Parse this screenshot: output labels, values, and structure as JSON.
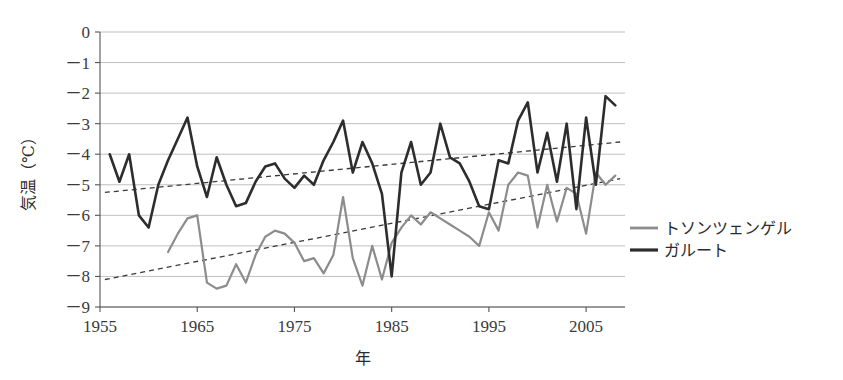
{
  "chart_data": {
    "type": "line",
    "title": "",
    "xlabel": "年",
    "ylabel": "気温（℃）",
    "xlim": [
      1955,
      2009
    ],
    "ylim": [
      -9,
      0
    ],
    "xticks": [
      1955,
      1965,
      1975,
      1985,
      1995,
      2005
    ],
    "yticks": [
      0,
      -1,
      -2,
      -3,
      -4,
      -5,
      -6,
      -7,
      -8,
      -9
    ],
    "ytick_labels": [
      "0",
      "－1",
      "－2",
      "－3",
      "－4",
      "－5",
      "－6",
      "－7",
      "－8",
      "－9"
    ],
    "xtick_labels": [
      "1955",
      "1965",
      "1975",
      "1985",
      "1995",
      "2005"
    ],
    "grid": true,
    "grid_axis": "y",
    "legend_position": "right",
    "series": [
      {
        "name": "トソンツェンゲル",
        "color": "#8c8c8c",
        "width": 2.2,
        "x": [
          1962,
          1963,
          1964,
          1965,
          1966,
          1967,
          1968,
          1969,
          1970,
          1971,
          1972,
          1973,
          1974,
          1975,
          1976,
          1977,
          1978,
          1979,
          1980,
          1981,
          1982,
          1983,
          1984,
          1985,
          1986,
          1987,
          1988,
          1989,
          1990,
          1991,
          1992,
          1993,
          1994,
          1995,
          1996,
          1997,
          1998,
          1999,
          2000,
          2001,
          2002,
          2003,
          2004,
          2005,
          2006,
          2007,
          2008
        ],
        "y": [
          -7.2,
          -6.6,
          -6.1,
          -6.0,
          -8.2,
          -8.4,
          -8.3,
          -7.6,
          -8.2,
          -7.3,
          -6.7,
          -6.5,
          -6.6,
          -6.9,
          -7.5,
          -7.4,
          -7.9,
          -7.3,
          -5.4,
          -7.4,
          -8.3,
          -7.0,
          -8.1,
          -6.9,
          -6.4,
          -6.0,
          -6.3,
          -5.9,
          -6.1,
          -6.3,
          -6.5,
          -6.7,
          -7.0,
          -5.9,
          -6.5,
          -5.0,
          -4.6,
          -4.7,
          -6.4,
          -5.0,
          -6.2,
          -5.1,
          -5.3,
          -6.6,
          -4.6,
          -5.0,
          -4.7
        ]
      },
      {
        "name": "ガルート",
        "color": "#2d2d2d",
        "width": 2.6,
        "x": [
          1956,
          1957,
          1958,
          1959,
          1960,
          1961,
          1962,
          1963,
          1964,
          1965,
          1966,
          1967,
          1968,
          1969,
          1970,
          1971,
          1972,
          1973,
          1974,
          1975,
          1976,
          1977,
          1978,
          1979,
          1980,
          1981,
          1982,
          1983,
          1984,
          1985,
          1986,
          1987,
          1988,
          1989,
          1990,
          1991,
          1992,
          1993,
          1994,
          1995,
          1996,
          1997,
          1998,
          1999,
          2000,
          2001,
          2002,
          2003,
          2004,
          2005,
          2006,
          2007,
          2008
        ],
        "y": [
          -4.0,
          -4.9,
          -4.0,
          -6.0,
          -6.4,
          -5.0,
          -4.2,
          -3.5,
          -2.8,
          -4.4,
          -5.4,
          -4.1,
          -5.0,
          -5.7,
          -5.6,
          -4.9,
          -4.4,
          -4.3,
          -4.8,
          -5.1,
          -4.7,
          -5.0,
          -4.2,
          -3.6,
          -2.9,
          -4.6,
          -3.6,
          -4.3,
          -5.3,
          -8.0,
          -4.6,
          -3.6,
          -5.0,
          -4.6,
          -3.0,
          -4.1,
          -4.3,
          -4.9,
          -5.7,
          -5.8,
          -4.2,
          -4.3,
          -2.9,
          -2.3,
          -4.6,
          -3.3,
          -4.9,
          -3.0,
          -5.8,
          -2.8,
          -5.0,
          -2.1,
          -2.4
        ]
      }
    ],
    "trendlines": [
      {
        "name": "ガルート trend",
        "style": "dashed",
        "color": "#3a3a3a",
        "x": [
          1955.5,
          2008.5
        ],
        "y": [
          -5.25,
          -3.6
        ]
      },
      {
        "name": "トソンツェンゲル trend",
        "style": "dashed",
        "color": "#3a3a3a",
        "x": [
          1955.5,
          2008.5
        ],
        "y": [
          -8.1,
          -4.8
        ]
      }
    ]
  },
  "axes": {
    "y_axis_title": "気温（℃）",
    "x_axis_title": "年"
  },
  "legend": {
    "items": [
      {
        "label": "トソンツェンゲル",
        "color": "#8c8c8c"
      },
      {
        "label": "ガルート",
        "color": "#2d2d2d"
      }
    ]
  }
}
